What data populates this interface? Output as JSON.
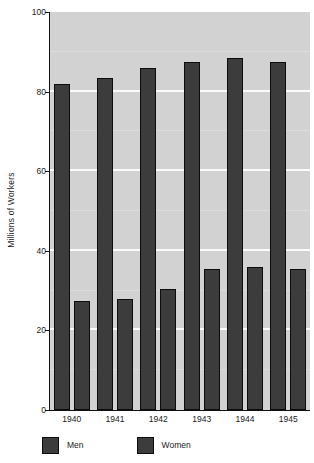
{
  "chart_data": {
    "type": "bar",
    "title": "",
    "subtitle": "",
    "xlabel": "",
    "ylabel": "Millions of Workers",
    "categories": [
      "1940",
      "1941",
      "1942",
      "1943",
      "1944",
      "1945"
    ],
    "series": [
      {
        "name": "Men",
        "values": [
          82,
          83.5,
          86,
          87.5,
          88.5,
          87.5
        ],
        "color": "#3c3c3c"
      },
      {
        "name": "Women",
        "values": [
          27.5,
          28,
          30.5,
          35.5,
          36,
          35.5
        ],
        "color": "#3c3c3c"
      }
    ],
    "ylim": [
      0,
      100
    ],
    "yticks": [
      0,
      20,
      40,
      60,
      80,
      100
    ],
    "ytick_labels": [
      "0",
      "20",
      "40",
      "60",
      "80",
      "100"
    ],
    "minor_yticks": [
      10,
      30,
      50,
      70,
      90
    ],
    "grid": true,
    "grid_axis": "y",
    "grid_color": "#fbfbfb",
    "legend": {
      "position": "below-axes-left",
      "entries": [
        "Men",
        "Women"
      ]
    },
    "plot_background": "#d2d2d2",
    "bar_edge_color": "#0c0c0c",
    "axis_color": "#111111"
  }
}
